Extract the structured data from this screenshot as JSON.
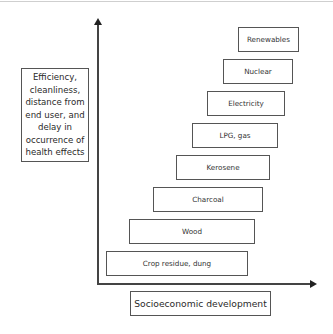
{
  "diagram": {
    "y_axis_label": "Efficiency,\ncleanliness,\ndistance from\nend user, and\ndelay in\noccurrence of\nhealth effects",
    "x_axis_label": "Socioeconomic development",
    "energy_ladder": [
      {
        "label": "Crop residue, dung",
        "rank": 1
      },
      {
        "label": "Wood",
        "rank": 2
      },
      {
        "label": "Charcoal",
        "rank": 3
      },
      {
        "label": "Kerosene",
        "rank": 4
      },
      {
        "label": "LPG, gas",
        "rank": 5
      },
      {
        "label": "Electricity",
        "rank": 6
      },
      {
        "label": "Nuclear",
        "rank": 7
      },
      {
        "label": "Renewables",
        "rank": 8
      }
    ]
  }
}
